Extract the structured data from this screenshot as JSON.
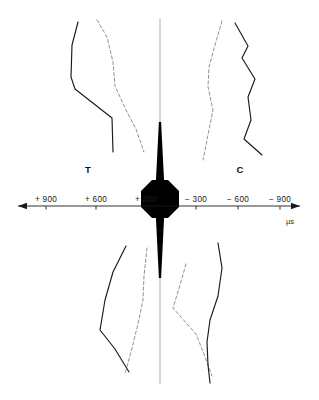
{
  "chart_data": {
    "type": "line",
    "title": "",
    "xlabel": "µs",
    "ylabel": "",
    "xlim": [
      1100,
      -1100
    ],
    "grid": false,
    "legend": "none",
    "axis": {
      "unit": "µs",
      "left_arrow": true,
      "right_arrow": true,
      "tick_labels": [
        "+ 900",
        "+ 600",
        "+ 300",
        "− 300",
        "− 600",
        "− 900"
      ],
      "tick_values": [
        900,
        600,
        300,
        -300,
        -600,
        -900
      ],
      "tick_px_x": [
        46,
        96,
        146,
        196,
        238,
        280
      ],
      "axis_y_px": 206,
      "axis_x_start_px": 18,
      "axis_x_end_px": 300
    },
    "region_labels": [
      {
        "text": "T",
        "x_px": 88,
        "y_px": 173
      },
      {
        "text": "C",
        "x_px": 240,
        "y_px": 173
      }
    ],
    "center_marker": {
      "description": "filled-octagon-with-vertical-spikes",
      "color": "#000000",
      "center_x_px": 160,
      "center_y_px": 199,
      "octagon_half_width_px": 19,
      "octagon_half_height_px": 19,
      "top_spike_tip_y_px": 122,
      "bottom_spike_tip_y_px": 278
    },
    "vertical_centerline": {
      "x_px": 160,
      "y_top_px": 18,
      "y_bottom_px": 384,
      "color": "#9a9a9a"
    },
    "series": [
      {
        "name": "upper-left-solid",
        "style": "solid",
        "color": "#1a1a1a",
        "points_px": [
          [
            78,
            22
          ],
          [
            72,
            45
          ],
          [
            71,
            77
          ],
          [
            75,
            89
          ],
          [
            112,
            118
          ],
          [
            113,
            152
          ]
        ]
      },
      {
        "name": "upper-left-dashed",
        "style": "dashed",
        "color": "#7d7d7d",
        "points_px": [
          [
            97,
            20
          ],
          [
            107,
            37
          ],
          [
            113,
            62
          ],
          [
            115,
            86
          ],
          [
            126,
            110
          ],
          [
            136,
            129
          ],
          [
            144,
            152
          ]
        ]
      },
      {
        "name": "upper-right-dashed",
        "style": "dashed",
        "color": "#7d7d7d",
        "points_px": [
          [
            222,
            21
          ],
          [
            215,
            45
          ],
          [
            209,
            67
          ],
          [
            208,
            87
          ],
          [
            213,
            110
          ],
          [
            209,
            130
          ],
          [
            203,
            160
          ]
        ]
      },
      {
        "name": "upper-right-solid",
        "style": "solid",
        "color": "#1a1a1a",
        "points_px": [
          [
            235,
            23
          ],
          [
            248,
            46
          ],
          [
            242,
            58
          ],
          [
            255,
            79
          ],
          [
            248,
            97
          ],
          [
            251,
            120
          ],
          [
            244,
            139
          ],
          [
            262,
            155
          ]
        ]
      },
      {
        "name": "lower-left-solid",
        "style": "solid",
        "color": "#1a1a1a",
        "points_px": [
          [
            126,
            246
          ],
          [
            113,
            272
          ],
          [
            105,
            300
          ],
          [
            100,
            330
          ],
          [
            115,
            349
          ],
          [
            129,
            372
          ]
        ]
      },
      {
        "name": "lower-left-dashed",
        "style": "dashed",
        "color": "#7d7d7d",
        "points_px": [
          [
            147,
            248
          ],
          [
            144,
            276
          ],
          [
            143,
            300
          ],
          [
            138,
            324
          ],
          [
            132,
            348
          ],
          [
            125,
            374
          ]
        ]
      },
      {
        "name": "lower-right-dashed",
        "style": "dashed",
        "color": "#7d7d7d",
        "points_px": [
          [
            186,
            264
          ],
          [
            180,
            285
          ],
          [
            173,
            308
          ],
          [
            196,
            334
          ],
          [
            204,
            354
          ],
          [
            212,
            376
          ]
        ]
      },
      {
        "name": "lower-right-solid",
        "style": "solid",
        "color": "#1a1a1a",
        "points_px": [
          [
            218,
            243
          ],
          [
            222,
            268
          ],
          [
            218,
            296
          ],
          [
            210,
            320
          ],
          [
            207,
            342
          ],
          [
            208,
            365
          ],
          [
            210,
            383
          ]
        ]
      }
    ]
  },
  "figure": {
    "background": "#ffffff",
    "axis_color": "#1a1a1a",
    "centerline_color": "#9a9a9a",
    "solid_trace_color": "#1a1a1a",
    "dashed_trace_color": "#7d7d7d"
  }
}
